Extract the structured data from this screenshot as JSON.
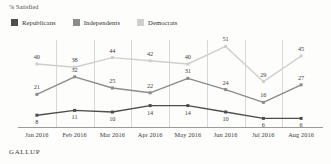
{
  "chart": {
    "axis_title": "% Satisfied",
    "source": "GALLUP"
  },
  "legend": {
    "items": [
      {
        "label": "Republicans",
        "color": "#4d4d4d"
      },
      {
        "label": "Independents",
        "color": "#8c8c8c"
      },
      {
        "label": "Democrats",
        "color": "#cfcfcf"
      }
    ]
  },
  "chart_data": {
    "type": "line",
    "title": "% Satisfied",
    "xlabel": "",
    "ylabel": "% Satisfied",
    "ylim": [
      0,
      55
    ],
    "grid": "vertical",
    "legend_position": "top-left",
    "source": "GALLUP",
    "categories": [
      "Jan 2016",
      "Feb 2016",
      "Mar 2016",
      "Apr 2016",
      "May 2016",
      "Jun 2016",
      "Jul 2016",
      "Aug 2016"
    ],
    "series": [
      {
        "name": "Republicans",
        "color": "#4d4d4d",
        "values": [
          8,
          11,
          10,
          14,
          14,
          10,
          6,
          6
        ]
      },
      {
        "name": "Independents",
        "color": "#8c8c8c",
        "values": [
          21,
          32,
          25,
          22,
          31,
          24,
          16,
          27
        ]
      },
      {
        "name": "Democrats",
        "color": "#cfcfcf",
        "values": [
          40,
          38,
          44,
          42,
          40,
          51,
          29,
          45
        ]
      }
    ]
  }
}
